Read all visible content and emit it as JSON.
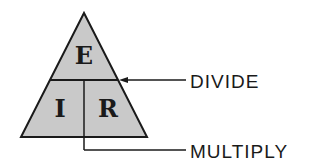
{
  "diagram": {
    "letters": {
      "top": "E",
      "bottom_left": "I",
      "bottom_right": "R"
    },
    "labels": {
      "divide": "DIVIDE",
      "multiply": "MULTIPLY"
    },
    "colors": {
      "fill": "#c9c9c9",
      "stroke": "#1a1a1a",
      "text": "#1a1a1a"
    }
  }
}
